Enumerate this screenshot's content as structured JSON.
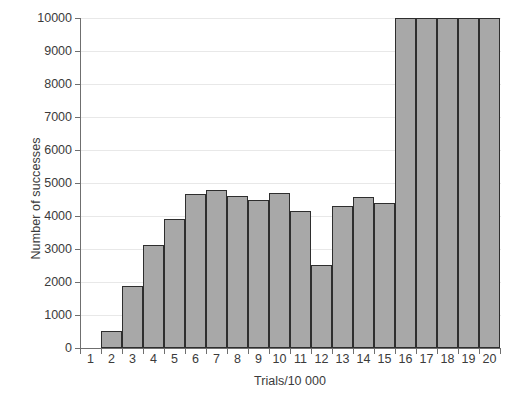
{
  "chart_data": {
    "type": "bar",
    "title": "",
    "xlabel": "Trials/10 000",
    "ylabel": "Number of successes",
    "categories": [
      "1",
      "2",
      "3",
      "4",
      "5",
      "6",
      "7",
      "8",
      "9",
      "10",
      "11",
      "12",
      "13",
      "14",
      "15",
      "16",
      "17",
      "18",
      "19",
      "20"
    ],
    "values": [
      0,
      520,
      1880,
      3130,
      3900,
      4680,
      4790,
      4600,
      4480,
      4690,
      4140,
      2530,
      4300,
      4570,
      4390,
      10000,
      10000,
      10000,
      10000,
      10000
    ],
    "ylim": [
      0,
      10000
    ],
    "yticks": [
      "0",
      "1000",
      "2000",
      "3000",
      "4000",
      "5000",
      "6000",
      "7000",
      "8000",
      "9000",
      "10000"
    ],
    "ytick_values": [
      0,
      1000,
      2000,
      3000,
      4000,
      5000,
      6000,
      7000,
      8000,
      9000,
      10000
    ],
    "grid": true,
    "legend": "none",
    "bar_fill_color": "#a8a8a8",
    "bar_edge_color": "#2e2e2e",
    "axis_color": "#6f6f6f",
    "grid_color": "#e8e8e8",
    "text_color": "#3b3b3b",
    "background_color": "#ffffff"
  }
}
